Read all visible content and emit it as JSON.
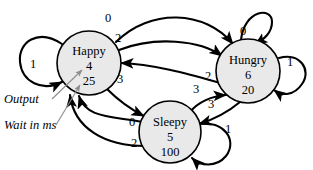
{
  "diagram": {
    "type": "finite-state-machine",
    "title": "",
    "background_color": "#ffffff",
    "node_fill_color": "#e9e9e9",
    "node_stroke_color": "#000000",
    "leader_color": "#8d8d8d"
  },
  "states": [
    {
      "id": "happy",
      "name": "Happy",
      "output": "4",
      "wait_ms": "25",
      "cx": 89,
      "cy": 63,
      "r": 32
    },
    {
      "id": "hungry",
      "name": "Hungry",
      "output": "6",
      "wait_ms": "20",
      "cx": 248,
      "cy": 71,
      "r": 32
    },
    {
      "id": "sleepy",
      "name": "Sleepy",
      "output": "5",
      "wait_ms": "100",
      "cx": 170,
      "cy": 132,
      "r": 31
    }
  ],
  "transitions": [
    {
      "id": "happy-self",
      "from": "happy",
      "to": "happy",
      "input": "1",
      "label_x": 33,
      "label_y": 68
    },
    {
      "id": "happy-hungry-0",
      "from": "happy",
      "to": "hungry",
      "input": "0",
      "label_x": 108,
      "label_y": 22
    },
    {
      "id": "happy-hungry-2",
      "from": "happy",
      "to": "hungry",
      "input": "2",
      "label_x": 118,
      "label_y": 42
    },
    {
      "id": "hungry-self-0",
      "from": "hungry",
      "to": "hungry",
      "input": "0",
      "label_x": 243,
      "label_y": 35
    },
    {
      "id": "hungry-self-1",
      "from": "hungry",
      "to": "hungry",
      "input": "1",
      "label_x": 290,
      "label_y": 66
    },
    {
      "id": "hungry-happy-2",
      "from": "hungry",
      "to": "happy",
      "input": "2",
      "label_x": 208,
      "label_y": 80
    },
    {
      "id": "happy-sleepy-3",
      "from": "happy",
      "to": "sleepy",
      "input": "3",
      "label_x": 120,
      "label_y": 83
    },
    {
      "id": "sleepy-hungry-3",
      "from": "sleepy",
      "to": "hungry",
      "input": "3",
      "label_x": 196,
      "label_y": 93
    },
    {
      "id": "hungry-sleepy-3",
      "from": "hungry",
      "to": "sleepy",
      "input": "3",
      "label_x": 211,
      "label_y": 108
    },
    {
      "id": "sleepy-happy-0",
      "from": "sleepy",
      "to": "happy",
      "input": "0",
      "label_x": 132,
      "label_y": 126
    },
    {
      "id": "sleepy-happy-2",
      "from": "sleepy",
      "to": "happy",
      "input": "2",
      "label_x": 134,
      "label_y": 147
    },
    {
      "id": "sleepy-self-1",
      "from": "sleepy",
      "to": "sleepy",
      "input": "1",
      "label_x": 228,
      "label_y": 133
    }
  ],
  "annotations": [
    {
      "id": "output-annotation",
      "text": "Output",
      "x": 4,
      "y": 103
    },
    {
      "id": "wait-annotation",
      "text": "Wait in ms",
      "x": 4,
      "y": 129
    }
  ]
}
